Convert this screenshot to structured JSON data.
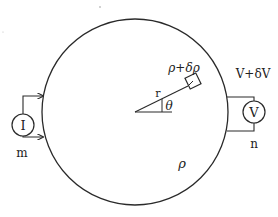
{
  "diagram": {
    "type": "four-probe resistivity measurement on circular sample",
    "sample_region_label": "ρ",
    "inclusion_label": "ρ+δρ",
    "radius_label": "r",
    "angle_label": "θ",
    "current_source": {
      "symbol": "I",
      "contact_label": "m"
    },
    "voltmeter": {
      "symbol": "V",
      "contact_label": "n",
      "reading_label": "V+δV"
    },
    "colors": {
      "stroke": "#2a2a2a",
      "background": "#ffffff"
    }
  }
}
